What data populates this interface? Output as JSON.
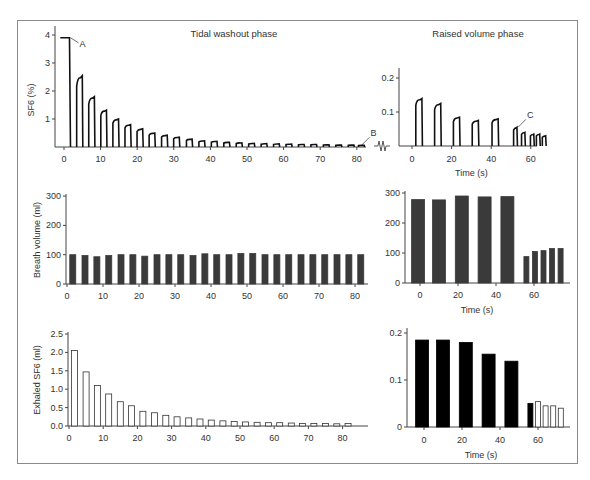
{
  "panels": {
    "top_left_title": "Tidal washout phase",
    "top_right_title": "Raised volume phase"
  },
  "chart_data": [
    {
      "id": "sf6_tidal",
      "type": "line",
      "title": "Tidal washout phase",
      "xlabel": "",
      "ylabel": "SF6 (%)",
      "yticks": [
        1,
        2,
        3,
        4
      ],
      "xticks": [
        0,
        10,
        20,
        30,
        40,
        50,
        60,
        70,
        80
      ],
      "ylim": [
        0,
        4.2
      ],
      "xlim": [
        -3,
        84
      ],
      "plateau": {
        "x0": -1,
        "x1": 1.5,
        "y": 3.9
      },
      "breath_peaks_x": [
        5,
        8.3,
        11.6,
        14.9,
        18.2,
        21.5,
        24.8,
        28.2,
        31.5,
        35,
        38.4,
        41.8,
        45.2,
        48.6,
        52,
        55.4,
        58.8,
        62.2,
        65.6,
        69,
        72.4,
        75.8,
        79.2,
        82
      ],
      "breath_peaks_y": [
        2.55,
        1.8,
        1.32,
        1.0,
        0.8,
        0.65,
        0.5,
        0.42,
        0.35,
        0.28,
        0.22,
        0.2,
        0.17,
        0.15,
        0.13,
        0.12,
        0.11,
        0.1,
        0.09,
        0.09,
        0.08,
        0.07,
        0.07,
        0.06
      ],
      "annotations": [
        {
          "label": "A",
          "x": 1.5,
          "y": 3.9
        },
        {
          "label": "B",
          "x": 81,
          "y": 0.06
        }
      ]
    },
    {
      "id": "sf6_raised",
      "type": "line",
      "title": "Raised volume phase",
      "xlabel": "Time (s)",
      "ylabel": "",
      "yticks": [
        0.1,
        0.2
      ],
      "xticks": [
        0,
        20,
        40,
        60
      ],
      "ylim": [
        0,
        0.23
      ],
      "xlim": [
        -6,
        70
      ],
      "breath_peaks_x": [
        5,
        14.5,
        24,
        33.5,
        43.5,
        53,
        57,
        61.5,
        64.5,
        67.5
      ],
      "breath_peaks_y": [
        0.14,
        0.125,
        0.085,
        0.075,
        0.08,
        0.055,
        0.04,
        0.035,
        0.035,
        0.03
      ],
      "annotations": [
        {
          "label": "C",
          "x": 53,
          "y": 0.055
        }
      ]
    },
    {
      "id": "breath_volume_tidal",
      "type": "bar",
      "xlabel": "",
      "ylabel": "Breath volume (ml)",
      "yticks": [
        0,
        100,
        200,
        300
      ],
      "xticks": [
        0,
        10,
        20,
        30,
        40,
        50,
        60,
        70,
        80
      ],
      "ylim": [
        0,
        300
      ],
      "xlim": [
        0,
        84
      ],
      "x": [
        1.6,
        5,
        8.3,
        11.6,
        15,
        18.3,
        21.6,
        25,
        28.3,
        31.6,
        35,
        38.3,
        41.6,
        45,
        48.3,
        51.6,
        55,
        58.3,
        61.6,
        65,
        68.3,
        71.6,
        75,
        78.3,
        81.6
      ],
      "values": [
        100,
        97,
        93,
        97,
        100,
        100,
        95,
        100,
        100,
        100,
        97,
        103,
        100,
        100,
        104,
        104,
        100,
        100,
        100,
        100,
        100,
        100,
        100,
        100,
        100
      ],
      "fill": "#3a3a3a"
    },
    {
      "id": "breath_volume_raised",
      "type": "bar",
      "xlabel": "Time (s)",
      "ylabel": "",
      "yticks": [
        0,
        100,
        200,
        300
      ],
      "xticks": [
        0,
        20,
        40,
        60
      ],
      "ylim": [
        0,
        300
      ],
      "xlim": [
        -8,
        76
      ],
      "x": [
        -1,
        10,
        22,
        34,
        46,
        56,
        60.5,
        65,
        69.5,
        74
      ],
      "values": [
        278,
        277,
        290,
        287,
        288,
        88,
        105,
        108,
        115,
        115
      ],
      "fill": "#3a3a3a"
    },
    {
      "id": "exhaled_sf6_tidal",
      "type": "bar",
      "xlabel": "",
      "ylabel": "Exhaled SF6 (ml)",
      "yticks": [
        0.0,
        0.5,
        1.0,
        1.5,
        2.0,
        2.5
      ],
      "xticks": [
        0,
        10,
        20,
        30,
        40,
        50,
        60,
        70,
        80
      ],
      "ylim": [
        0,
        2.5
      ],
      "xlim": [
        0,
        84
      ],
      "x": [
        1.6,
        5,
        8.3,
        11.6,
        15,
        18.3,
        21.6,
        25,
        28.3,
        31.6,
        35,
        38.3,
        41.6,
        45,
        48.3,
        51.6,
        55,
        58.3,
        61.6,
        65,
        68.3,
        71.6,
        75,
        78.3,
        81.6
      ],
      "values": [
        2.05,
        1.47,
        1.1,
        0.87,
        0.66,
        0.55,
        0.4,
        0.36,
        0.29,
        0.25,
        0.22,
        0.19,
        0.16,
        0.14,
        0.12,
        0.11,
        0.1,
        0.09,
        0.09,
        0.08,
        0.07,
        0.07,
        0.07,
        0.06,
        0.07
      ],
      "fill": "#ffffff"
    },
    {
      "id": "exhaled_sf6_raised",
      "type": "bar",
      "xlabel": "Time (s)",
      "ylabel": "",
      "yticks": [
        0,
        0.1,
        0.2
      ],
      "xticks": [
        0,
        20,
        40,
        60
      ],
      "ylim": [
        0,
        0.2
      ],
      "xlim": [
        -8,
        76
      ],
      "x": [
        -1,
        10,
        22,
        34,
        46,
        56,
        60,
        64,
        68,
        72
      ],
      "values": [
        0.185,
        0.185,
        0.18,
        0.155,
        0.14,
        0.05,
        0.054,
        0.045,
        0.045,
        0.04
      ],
      "fills": [
        "#000000",
        "#000000",
        "#000000",
        "#000000",
        "#000000",
        "#000000",
        "#ffffff",
        "#ffffff",
        "#ffffff",
        "#ffffff"
      ]
    }
  ]
}
